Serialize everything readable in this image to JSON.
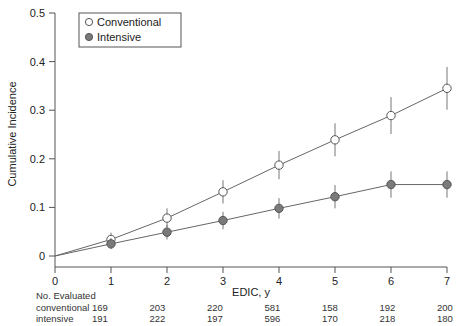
{
  "chart_data": {
    "type": "line",
    "title": "",
    "xlabel": "EDIC, y",
    "ylabel": "Cumulative Incidence",
    "x": [
      0,
      1,
      2,
      3,
      4,
      5,
      6,
      7
    ],
    "xlim": [
      0,
      7
    ],
    "ylim": [
      0,
      0.5
    ],
    "ytick_labels": [
      "0",
      "0.1",
      "0.2",
      "0.3",
      "0.4",
      "0.5"
    ],
    "ytick_values": [
      0,
      0.1,
      0.2,
      0.3,
      0.4,
      0.5
    ],
    "xtick_labels": [
      "0",
      "1",
      "2",
      "3",
      "4",
      "5",
      "6",
      "7"
    ],
    "grid": false,
    "legend_position": "top-left",
    "series": [
      {
        "name": "Conventional",
        "marker": "open-circle",
        "values": [
          0,
          0.034,
          0.078,
          0.132,
          0.187,
          0.239,
          0.289,
          0.345
        ],
        "error_low": [
          0,
          0.021,
          0.059,
          0.108,
          0.158,
          0.205,
          0.251,
          0.301
        ],
        "error_high": [
          0,
          0.048,
          0.098,
          0.156,
          0.216,
          0.273,
          0.327,
          0.389
        ]
      },
      {
        "name": "Intensive",
        "marker": "filled-circle",
        "values": [
          0,
          0.025,
          0.049,
          0.073,
          0.098,
          0.122,
          0.147,
          0.147
        ],
        "error_low": [
          0,
          0.014,
          0.034,
          0.055,
          0.077,
          0.098,
          0.12,
          0.12
        ],
        "error_high": [
          0,
          0.037,
          0.064,
          0.091,
          0.119,
          0.146,
          0.174,
          0.174
        ]
      }
    ]
  },
  "legend": {
    "entries": [
      {
        "label": "Conventional",
        "marker": "open-circle"
      },
      {
        "label": "Intensive",
        "marker": "filled-circle"
      }
    ]
  },
  "risk_table": {
    "title": "No. Evaluated",
    "rows": [
      {
        "label": "conventional",
        "values": [
          "169",
          "203",
          "220",
          "581",
          "158",
          "192",
          "200"
        ]
      },
      {
        "label": "intensive",
        "values": [
          "191",
          "222",
          "197",
          "596",
          "170",
          "218",
          "180"
        ]
      }
    ]
  },
  "colors": {
    "axis": "#555555",
    "line": "#666666",
    "intensive_fill": "#7a7a7a",
    "conventional_fill": "#ffffff",
    "text": "#222222"
  }
}
